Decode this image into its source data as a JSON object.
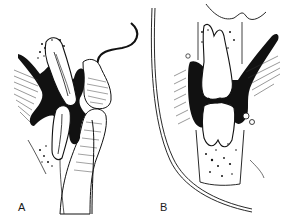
{
  "figure": {
    "background": "#ffffff",
    "ink_color": "#111111",
    "panels": [
      {
        "id": "A",
        "label": "A",
        "subject": "sagittal section of incisor teeth with lip and surrounding tissue"
      },
      {
        "id": "B",
        "label": "B",
        "subject": "cross section of molar teeth in occlusion with cheek outline"
      }
    ]
  }
}
